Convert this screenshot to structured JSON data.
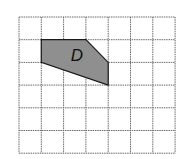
{
  "diagram": {
    "type": "grid-polygon",
    "grid": {
      "columns": 7,
      "rows": 6,
      "origin_px": [
        19,
        17
      ],
      "cell_w_px": 22.3,
      "cell_h_px": 22.7,
      "line_color": "#6b6b6b"
    },
    "shapes": [
      {
        "label": "D",
        "fill": "#8f8f8f",
        "vertices_grid": [
          [
            1,
            1
          ],
          [
            3,
            1
          ],
          [
            4,
            2
          ],
          [
            4,
            3
          ],
          [
            1,
            2
          ]
        ],
        "label_pos_grid": [
          2.6,
          1.75
        ]
      }
    ]
  }
}
